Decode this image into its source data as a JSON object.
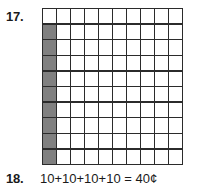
{
  "page": {
    "background_color": "#ffffff",
    "text_color": "#1a1a1a"
  },
  "items": [
    {
      "number_label": "17.",
      "type": "shaded-grid",
      "grid": {
        "columns": 10,
        "rows": 10,
        "total_cells": 100,
        "shaded_count": 9,
        "shaded_color": "#808080",
        "empty_color": "#ffffff",
        "line_color": "#2b2b2b",
        "shaded_cells": [
          [
            1,
            0
          ],
          [
            2,
            0
          ],
          [
            3,
            0
          ],
          [
            4,
            0
          ],
          [
            5,
            0
          ],
          [
            6,
            0
          ],
          [
            7,
            0
          ],
          [
            8,
            0
          ],
          [
            9,
            0
          ]
        ]
      }
    },
    {
      "number_label": "18.",
      "type": "equation",
      "equation": "10+10+10+10 = 40¢"
    }
  ]
}
